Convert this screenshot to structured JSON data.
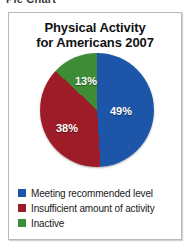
{
  "page_header": "Pie Chart",
  "chart_data": {
    "type": "pie",
    "title": "Physical Activity for Americans 2007",
    "title_lines": [
      "Physical Activity",
      "for Americans 2007"
    ],
    "categories": [
      "Meeting recommended level",
      "Insufficient amount of activity",
      "Inactive"
    ],
    "values": [
      49,
      38,
      13
    ],
    "value_labels": [
      "49%",
      "38%",
      "13%"
    ],
    "colors": [
      "#1d56a8",
      "#9e1c28",
      "#3f8c36"
    ],
    "start_angle_deg": 0,
    "direction": "clockwise",
    "legend_position": "bottom-left",
    "grid": false,
    "xlabel": "",
    "ylabel": "",
    "slices": [
      {
        "label": "Meeting recommended level",
        "value": 49,
        "value_label": "49%",
        "color": "#1d56a8"
      },
      {
        "label": "Insufficient amount of activity",
        "value": 38,
        "value_label": "38%",
        "color": "#9e1c28"
      },
      {
        "label": "Inactive",
        "value": 13,
        "value_label": "13%",
        "color": "#3f8c36"
      }
    ]
  }
}
